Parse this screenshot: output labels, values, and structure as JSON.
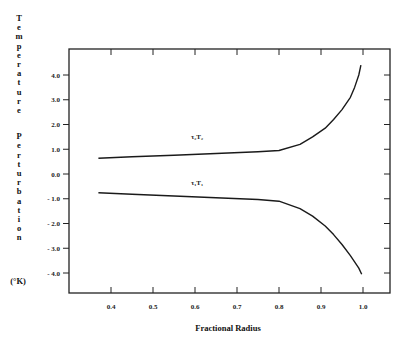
{
  "chart_data": {
    "type": "line",
    "title": "",
    "xlabel": "Fractional Radius",
    "ylabel": "Temperature Perturbation",
    "ylabel_units": "(°K)",
    "xlim": [
      0.32,
      1.05
    ],
    "ylim": [
      -4.6,
      5.2
    ],
    "xticks": [
      0.4,
      0.5,
      0.6,
      0.7,
      0.8,
      0.9,
      1.0
    ],
    "xtick_labels": [
      "0.4",
      "0.5",
      "0.6",
      "0.7",
      "0.8",
      "0.9",
      "1.0"
    ],
    "yticks": [
      4.0,
      3.0,
      2.0,
      1.0,
      0.0,
      -1.0,
      -2.0,
      -3.0,
      -4.0
    ],
    "ytick_labels": [
      "4.0",
      "3.0",
      "2.0",
      "1.0",
      "0.0",
      "- 1.0",
      "- 2.0",
      "- 3.0",
      "- 4.0"
    ],
    "grid": false,
    "legend": "none",
    "series": [
      {
        "name": "τ₂T₂",
        "label_at": [
          0.6,
          1.4
        ],
        "x": [
          0.37,
          0.45,
          0.55,
          0.65,
          0.75,
          0.8,
          0.85,
          0.88,
          0.91,
          0.93,
          0.95,
          0.97,
          0.98,
          0.99,
          0.995
        ],
        "y": [
          0.64,
          0.7,
          0.76,
          0.83,
          0.9,
          0.95,
          1.2,
          1.5,
          1.85,
          2.2,
          2.6,
          3.1,
          3.5,
          4.0,
          4.4
        ]
      },
      {
        "name": "τ₁T₁",
        "label_at": [
          0.6,
          -0.45
        ],
        "x": [
          0.37,
          0.45,
          0.55,
          0.65,
          0.75,
          0.8,
          0.85,
          0.88,
          0.91,
          0.93,
          0.95,
          0.97,
          0.98,
          0.99,
          0.997
        ],
        "y": [
          -0.76,
          -0.82,
          -0.89,
          -0.96,
          -1.03,
          -1.1,
          -1.4,
          -1.7,
          -2.1,
          -2.45,
          -2.85,
          -3.3,
          -3.55,
          -3.8,
          -4.05
        ]
      }
    ]
  }
}
